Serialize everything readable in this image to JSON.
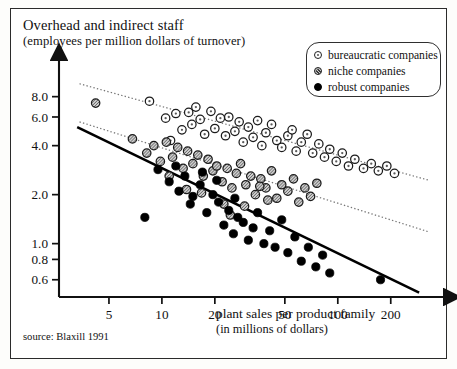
{
  "figure": {
    "title_line1": "Overhead and indirect staff",
    "title_line2": "(employees per million dollars of turnover)",
    "source": "source: Blaxill 1991"
  },
  "legend": {
    "items": [
      {
        "label": "bureaucratic companies",
        "marker": "open-circle-dot",
        "color": "#ffffff"
      },
      {
        "label": "niche companies",
        "marker": "hatched-circle",
        "color": "#b9b9b9"
      },
      {
        "label": "robust companies",
        "marker": "filled-circle",
        "color": "#000000"
      }
    ]
  },
  "chart_data": {
    "type": "scatter",
    "title": "Overhead and indirect staff (employees per million dollars of turnover)",
    "xlabel": "plant sales per product family (in millions of dollars)",
    "xlabel_line1": "plant sales per product family",
    "xlabel_line2": "(in millions of dollars)",
    "ylabel": "Overhead and indirect staff (employees per million dollars of turnover)",
    "xscale": "log",
    "yscale": "log",
    "xlim": [
      2.6,
      330
    ],
    "ylim": [
      0.47,
      11.5
    ],
    "grid": false,
    "legend_position": "top-right",
    "xticks": [
      5,
      10,
      20,
      50,
      100,
      200
    ],
    "xticklabels": [
      "5",
      "10",
      "20",
      "50",
      "100",
      "200"
    ],
    "yticks": [
      0.6,
      0.8,
      1.0,
      2.0,
      4.0,
      6.0,
      8.0
    ],
    "yticklabels": [
      "0.6",
      "0.8",
      "1.0",
      "2.0",
      "4.0",
      "6.0",
      "8.0"
    ],
    "series": [
      {
        "name": "bureaucratic companies",
        "marker": "open-circle-dot",
        "color": "#ffffff",
        "edgecolor": "#222222",
        "trendline": {
          "style": "dotted",
          "x": [
            3.4,
            330
          ],
          "y": [
            9.6,
            2.45
          ]
        },
        "points": [
          [
            8.5,
            7.5
          ],
          [
            10.5,
            5.9
          ],
          [
            11.2,
            4.3
          ],
          [
            12.0,
            6.3
          ],
          [
            13.0,
            5.0
          ],
          [
            14.2,
            6.4
          ],
          [
            14.8,
            5.4
          ],
          [
            15.6,
            6.9
          ],
          [
            16.5,
            5.8
          ],
          [
            17.5,
            4.7
          ],
          [
            19.0,
            6.5
          ],
          [
            20.0,
            5.1
          ],
          [
            21.5,
            5.9
          ],
          [
            23.0,
            4.6
          ],
          [
            24.0,
            6.0
          ],
          [
            26.0,
            4.9
          ],
          [
            27.5,
            5.6
          ],
          [
            29.0,
            4.2
          ],
          [
            31.0,
            5.2
          ],
          [
            33.0,
            4.5
          ],
          [
            35.0,
            5.7
          ],
          [
            37.0,
            4.0
          ],
          [
            39.0,
            4.8
          ],
          [
            42.0,
            5.4
          ],
          [
            45.0,
            4.3
          ],
          [
            48.0,
            3.9
          ],
          [
            52.0,
            4.6
          ],
          [
            55.0,
            5.0
          ],
          [
            58.0,
            3.7
          ],
          [
            62.0,
            4.2
          ],
          [
            67.0,
            4.7
          ],
          [
            72.0,
            3.6
          ],
          [
            78.0,
            4.1
          ],
          [
            84.0,
            3.4
          ],
          [
            90.0,
            3.8
          ],
          [
            98.0,
            3.2
          ],
          [
            106.0,
            3.6
          ],
          [
            115.0,
            3.0
          ],
          [
            125.0,
            3.3
          ],
          [
            140.0,
            2.9
          ],
          [
            155.0,
            3.1
          ],
          [
            170.0,
            2.8
          ],
          [
            190.0,
            3.0
          ],
          [
            210.0,
            2.7
          ]
        ]
      },
      {
        "name": "niche companies",
        "marker": "hatched-circle",
        "color": "#b9b9b9",
        "edgecolor": "#222222",
        "trendline": {
          "style": "dotted",
          "x": [
            3.4,
            330
          ],
          "y": [
            5.6,
            1.18
          ]
        },
        "points": [
          [
            4.2,
            7.3
          ],
          [
            6.8,
            4.4
          ],
          [
            8.2,
            3.6
          ],
          [
            9.0,
            4.0
          ],
          [
            9.8,
            3.2
          ],
          [
            10.6,
            4.2
          ],
          [
            11.5,
            3.4
          ],
          [
            12.3,
            3.9
          ],
          [
            13.2,
            2.9
          ],
          [
            14.0,
            3.7
          ],
          [
            15.0,
            3.1
          ],
          [
            16.0,
            3.5
          ],
          [
            17.2,
            2.6
          ],
          [
            18.3,
            3.3
          ],
          [
            19.5,
            2.8
          ],
          [
            20.5,
            3.0
          ],
          [
            22.0,
            2.4
          ],
          [
            23.5,
            2.9
          ],
          [
            25.0,
            2.2
          ],
          [
            26.5,
            2.7
          ],
          [
            28.0,
            3.1
          ],
          [
            30.0,
            2.3
          ],
          [
            32.0,
            2.6
          ],
          [
            34.0,
            2.0
          ],
          [
            36.5,
            2.5
          ],
          [
            39.0,
            2.2
          ],
          [
            42.0,
            2.8
          ],
          [
            45.0,
            1.9
          ],
          [
            48.0,
            2.3
          ],
          [
            52.0,
            2.1
          ],
          [
            56.0,
            2.5
          ],
          [
            60.0,
            1.8
          ],
          [
            65.0,
            2.2
          ],
          [
            70.0,
            1.95
          ],
          [
            76.0,
            2.35
          ],
          [
            36.0,
            2.25
          ],
          [
            40.0,
            1.85
          ],
          [
            22.5,
            1.75
          ],
          [
            24.5,
            1.5
          ],
          [
            16.8,
            2.05
          ],
          [
            13.8,
            2.15
          ],
          [
            11.0,
            2.6
          ],
          [
            29.5,
            1.7
          ]
        ]
      },
      {
        "name": "robust companies",
        "marker": "filled-circle",
        "color": "#000000",
        "edgecolor": "#000000",
        "trendline": {
          "style": "solid",
          "x": [
            3.3,
            290
          ],
          "y": [
            5.2,
            0.5
          ]
        },
        "points": [
          [
            8.0,
            1.45
          ],
          [
            9.5,
            2.85
          ],
          [
            11.0,
            2.4
          ],
          [
            12.5,
            2.1
          ],
          [
            13.5,
            2.6
          ],
          [
            15.0,
            1.95
          ],
          [
            16.5,
            2.3
          ],
          [
            18.0,
            1.55
          ],
          [
            19.5,
            2.0
          ],
          [
            21.0,
            1.8
          ],
          [
            22.5,
            1.3
          ],
          [
            24.0,
            1.6
          ],
          [
            25.5,
            1.15
          ],
          [
            27.0,
            1.45
          ],
          [
            29.0,
            1.35
          ],
          [
            31.0,
            1.05
          ],
          [
            33.0,
            1.25
          ],
          [
            35.0,
            1.55
          ],
          [
            38.0,
            1.0
          ],
          [
            41.0,
            1.2
          ],
          [
            44.0,
            0.95
          ],
          [
            48.0,
            1.4
          ],
          [
            52.0,
            0.88
          ],
          [
            57.0,
            1.1
          ],
          [
            62.0,
            0.78
          ],
          [
            68.0,
            0.95
          ],
          [
            75.0,
            0.72
          ],
          [
            82.0,
            0.85
          ],
          [
            90.0,
            0.66
          ],
          [
            20.5,
            2.45
          ],
          [
            17.0,
            2.75
          ],
          [
            14.5,
            1.75
          ],
          [
            26.0,
            1.9
          ],
          [
            175.0,
            0.6
          ],
          [
            12.0,
            3.0
          ]
        ]
      }
    ]
  }
}
